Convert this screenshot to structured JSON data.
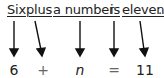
{
  "sentence": {
    "words": [
      {
        "text": "Six",
        "x": 7
      },
      {
        "text": "plus",
        "x": 26
      },
      {
        "text": "a number",
        "x": 53
      },
      {
        "text": "is",
        "x": 110
      },
      {
        "text": "eleven",
        "x": 122
      }
    ],
    "period": "."
  },
  "equation": {
    "symbols": [
      {
        "text": "6",
        "x": 14
      },
      {
        "text": "+",
        "x": 43
      },
      {
        "text": "n",
        "x": 80
      },
      {
        "text": "=",
        "x": 114
      },
      {
        "text": "11",
        "x": 145
      }
    ]
  },
  "colors": {
    "text": "#222222",
    "operator": "#666666",
    "arrow": "#111111"
  }
}
